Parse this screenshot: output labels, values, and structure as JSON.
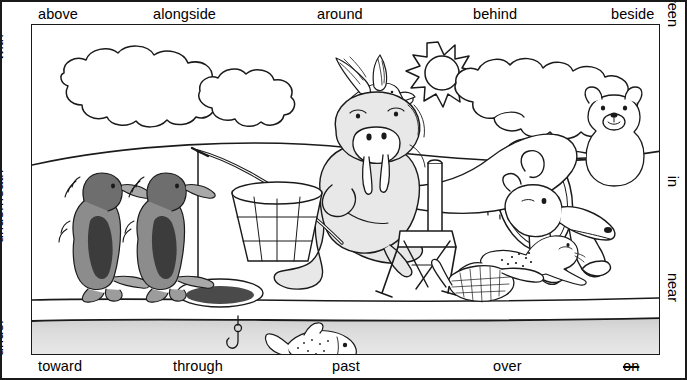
{
  "worksheet": {
    "title": "Prepositions picture worksheet",
    "top_labels": [
      {
        "text": "above",
        "x": 36,
        "name": "label-above"
      },
      {
        "text": "alongside",
        "x": 151,
        "name": "label-alongside"
      },
      {
        "text": "around",
        "x": 315,
        "name": "label-around"
      },
      {
        "text": "behind",
        "x": 471,
        "name": "label-behind"
      },
      {
        "text": "beside",
        "x": 609,
        "name": "label-beside"
      }
    ],
    "bottom_labels": [
      {
        "text": "toward",
        "x": 36,
        "name": "label-toward",
        "strike": false
      },
      {
        "text": "through",
        "x": 171,
        "name": "label-through",
        "strike": false
      },
      {
        "text": "past",
        "x": 330,
        "name": "label-past",
        "strike": false
      },
      {
        "text": "over",
        "x": 491,
        "name": "label-over",
        "strike": false
      },
      {
        "text": "on",
        "x": 621,
        "name": "label-on",
        "strike": true
      }
    ],
    "left_labels": [
      {
        "text": "with",
        "bottom": 318,
        "name": "label-with"
      },
      {
        "text": "underneath",
        "bottom": 135,
        "name": "label-underneath"
      },
      {
        "text": "under",
        "bottom": 22,
        "name": "label-under"
      }
    ],
    "right_labels": [
      {
        "text": "between",
        "top": 25,
        "name": "label-between"
      },
      {
        "text": "in",
        "top": 185,
        "name": "label-in"
      },
      {
        "text": "near",
        "top": 300,
        "name": "label-near"
      }
    ],
    "scene": {
      "caption": "Arctic scene: clouds, sun, flying bird, polar bears with hoop, walrus fishing through ice hole, penguins, seal, fish under ice",
      "objects": [
        "cloud-large-left",
        "cloud-small-left",
        "sun",
        "cloud-right",
        "flying-bird",
        "polar-bear-jumping",
        "polar-bear-holding-hoop",
        "hoop",
        "dashed-arc-trail",
        "walrus",
        "folding-chair",
        "fishing-rod",
        "bucket",
        "ice-hole",
        "snowshoes",
        "penguin-left",
        "penguin-right",
        "seal",
        "fish",
        "fish-hook",
        "snow-hill-horizon",
        "water-band"
      ],
      "colors": {
        "ink": "#1a1a1a",
        "penguin_dark": "#6e6e6e",
        "penguin_body": "#8c8c8c",
        "walrus_fill": "#e8e8e8",
        "water_fill": "#d9d9d9",
        "hole_fill": "#4a4a4a"
      }
    }
  }
}
